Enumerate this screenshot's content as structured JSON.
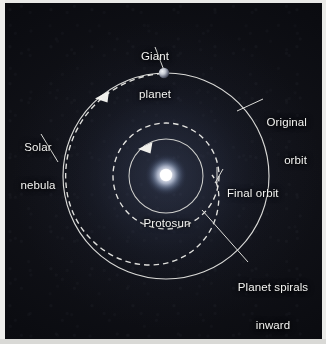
{
  "figure": {
    "type": "astronomy-diagram",
    "background_color": "#0a0b10",
    "stroke_color": "#e8e8e4",
    "text_color": "#f4f4f2"
  },
  "labels": {
    "giant_planet": "Giant\nplanet",
    "original_orbit": "Original\norbit",
    "solar_nebula": "Solar\nnebula",
    "final_orbit": "Final orbit",
    "protosun": "Protosun",
    "planet_spirals_inward": "Planet spirals\ninward"
  },
  "label_lines": {
    "giant_planet": [
      "Giant",
      "planet"
    ],
    "original_orbit": [
      "Original",
      "orbit"
    ],
    "solar_nebula": [
      "Solar",
      "nebula"
    ],
    "final_orbit": [
      "Final orbit"
    ],
    "protosun": [
      "Protosun"
    ],
    "planet_spirals_inward": [
      "Planet spirals",
      "inward"
    ]
  },
  "elements": {
    "protosun_body": "protosun-glow",
    "planet_body": "giant-planet-sphere",
    "original_orbit_path": "solid-outer-circle",
    "final_orbit_path": "dashed-inner-circle",
    "spiral_path": "dashed-inward-spiral",
    "inner_boundary": "solid-inner-circle",
    "direction_arrows": 2
  },
  "geometry": {
    "center_x": 161,
    "center_y": 173,
    "outer_orbit_radius": 103,
    "final_orbit_radius": 53,
    "inner_circle_radius": 37,
    "planet_x": 159,
    "planet_y": 70,
    "planet_radius": 5
  },
  "colors": {
    "orbit_stroke": "#e6e6e2",
    "dashed_stroke": "#eeeeea",
    "leader_stroke": "#dcdcd8",
    "protosun_core": "#ffffff",
    "protosun_halo": "#9fb4d8",
    "planet_lit": "#d8dbe2",
    "planet_dark": "#4a4e58"
  }
}
